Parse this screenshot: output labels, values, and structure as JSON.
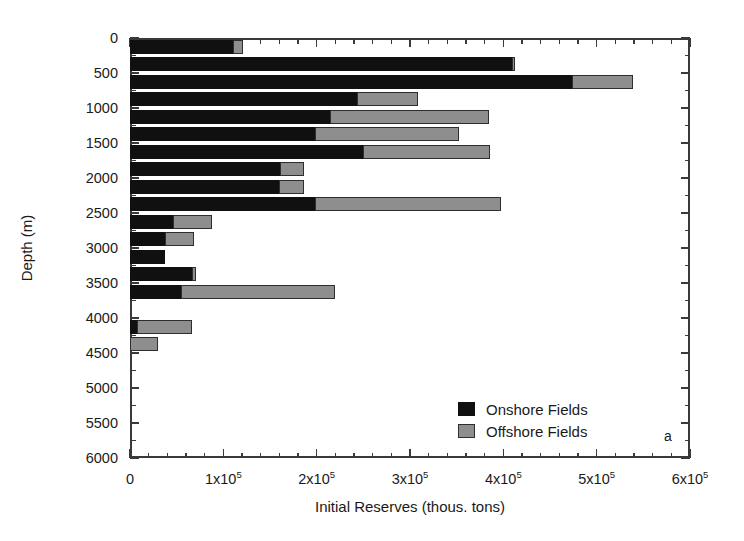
{
  "chart_data": {
    "type": "bar",
    "orientation": "horizontal",
    "stacked": true,
    "title": "",
    "panel_label": "a",
    "xlabel": "Initial Reserves (thous. tons)",
    "ylabel": "Depth (m)",
    "xlim": [
      0,
      600000
    ],
    "ylim": [
      0,
      6000
    ],
    "y_inverted": true,
    "grid": false,
    "legend_position": "bottom-right",
    "x_major_ticks": [
      0,
      100000,
      200000,
      300000,
      400000,
      500000,
      600000
    ],
    "x_tick_labels": [
      "0",
      "1x10^5",
      "2x10^5",
      "3x10^5",
      "4x10^5",
      "5x10^5",
      "6x10^5"
    ],
    "x_minor_tick_step": 20000,
    "y_major_ticks": [
      0,
      500,
      1000,
      1500,
      2000,
      2500,
      3000,
      3500,
      4000,
      4500,
      5000,
      5500,
      6000
    ],
    "y_tick_labels": [
      "0",
      "500",
      "1000",
      "1500",
      "2000",
      "2500",
      "3000",
      "3500",
      "4000",
      "4500",
      "5000",
      "5500",
      "6000"
    ],
    "y_minor_tick_step": 250,
    "bar_depth_interval": 250,
    "categories": [
      0,
      250,
      500,
      750,
      1000,
      1250,
      1500,
      1750,
      2000,
      2250,
      2500,
      2750,
      3000,
      3250,
      3500,
      4000,
      4250
    ],
    "series": [
      {
        "name": "Onshore Fields",
        "color": "#101010",
        "values": [
          110000,
          409000,
          474000,
          243000,
          214000,
          198000,
          250000,
          161000,
          160000,
          198000,
          46000,
          37000,
          37000,
          66000,
          55000,
          7000,
          0
        ]
      },
      {
        "name": "Offshore Fields",
        "color": "#8e8e8e",
        "values": [
          11000,
          4000,
          65000,
          66000,
          171000,
          155000,
          136000,
          25000,
          26000,
          200000,
          42000,
          32000,
          0,
          5000,
          165000,
          59000,
          30000
        ]
      }
    ],
    "totals": [
      121000,
      413000,
      539000,
      309000,
      385000,
      353000,
      386000,
      186000,
      186000,
      398000,
      88000,
      69000,
      37000,
      71000,
      220000,
      66000,
      30000
    ]
  },
  "legend": {
    "items": [
      {
        "label": "Onshore Fields",
        "swatch": "onshore"
      },
      {
        "label": "Offshore Fields",
        "swatch": "offshore"
      }
    ]
  }
}
